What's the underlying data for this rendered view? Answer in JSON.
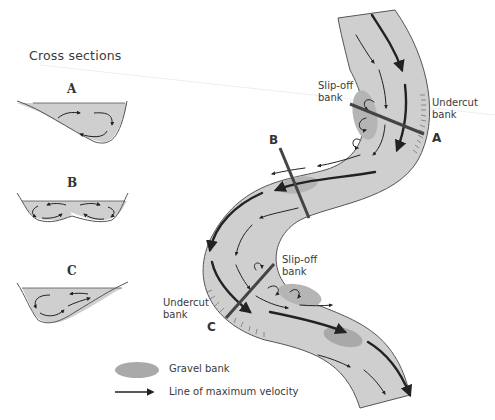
{
  "title": "Cross sections",
  "cross_sections": [
    {
      "id": "A",
      "label": "A",
      "shape": "asymmetric, deep on right (outer bank)"
    },
    {
      "id": "B",
      "label": "B",
      "shape": "symmetric, two helical cells"
    },
    {
      "id": "C",
      "label": "C",
      "shape": "asymmetric, deep on left (outer bank)"
    }
  ],
  "river_labels": {
    "slip_off_top": "Slip-off\nbank",
    "undercut_top": "Undercut\nbank",
    "section_a": "A",
    "section_b": "B",
    "slip_off_bottom": "Slip-off\nbank",
    "undercut_bottom": "Undercut\nbank",
    "section_c": "C"
  },
  "legend": {
    "gravel_bank": "Gravel bank",
    "max_velocity": "Line of maximum velocity"
  },
  "colors": {
    "water": "#cfcfcf",
    "gravel": "#a9a9a9",
    "outline": "#555555",
    "arrow": "#222222",
    "section_line": "#444444"
  }
}
